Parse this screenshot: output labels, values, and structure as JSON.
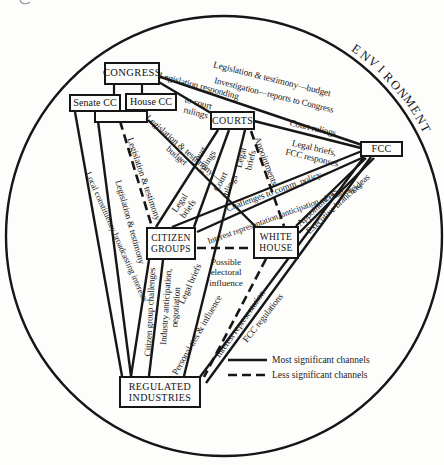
{
  "environment": "ENVIRONMENT",
  "nodes": {
    "congress": "CONGRESS",
    "senate_cc": "Senate CC",
    "house_cc": "House CC",
    "courts": "COURTS",
    "fcc": "FCC",
    "citizen_groups": "CITIZEN\nGROUPS",
    "white_house": "WHITE\nHOUSE",
    "regulated_industries": "REGULATED\nINDUSTRIES"
  },
  "edge_labels": {
    "leg_test_budget_fcc": "Legislation & testimony—budget",
    "investigation_reports": "Investigation—reports to Congress",
    "legislation_responding": "Legislation responding",
    "to_court_rulings": "to court\nrulings",
    "court_rulings_fcc": "Court rulings",
    "legal_briefs_fcc": "Legal briefs,\nFCC responses",
    "court_rulings_cg1": "Court\nrulings",
    "court_rulings_cg2": "Court\nrulings",
    "legal_briefs_courts": "Legal\nbriefs",
    "appointments_courts": "Appointments",
    "challenges_policy": "Challenges to comm. policy—",
    "interest_rep_anticipation": "Interest representation, anticipation of challenges",
    "appointments_fcc": "Appointments",
    "executive_branch_ideas": "Executive branch ideas",
    "leg_test_budget_wh": "Legislation & testimony—\nbudget",
    "legal_briefs_cg": "Legal\nbriefs",
    "leg_test_cg": "Legislation & testimony",
    "leg_test_ri": "Legislation & testimony",
    "local_constituency": "Local constituency broadcasting interests",
    "citizen_group_challenges": "Citizen group challenges",
    "industry_anticipation": "Industry anticipation,\nnegotiation",
    "legal_briefs_ri": "Legal briefs",
    "possible_electoral": "Possible\nelectoral\ninfluence",
    "personal_ties": "Personal ties & influence",
    "interest_rep_ri": "Interest representation",
    "fcc_regulations": "FCC regulations"
  },
  "legend": {
    "solid": "Most significant channels",
    "dashed": "Less significant channels"
  }
}
